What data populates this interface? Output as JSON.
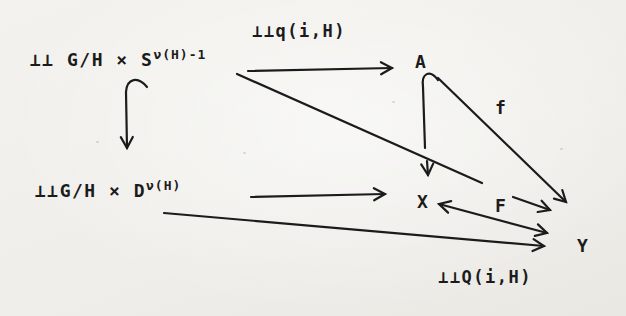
{
  "page": {
    "background": "#f1f0ec",
    "ink": "#1b1b1b",
    "kind": "scanned typewritten commutative diagram"
  },
  "diagram": {
    "nodes": {
      "top_left": {
        "base": "⊥⊥ G/H × S",
        "sup": "ν(H)-1"
      },
      "bottom_left": {
        "base": "⊥⊥G/H × D",
        "sup": "ν(H)"
      },
      "A": "A",
      "X": "X",
      "Y": "Y"
    },
    "labels": {
      "q_arrow": "⊥⊥q(i,H)",
      "f": "f",
      "F": "F",
      "Q_bottom": "⊥⊥Q(i,H)"
    },
    "arrows": [
      {
        "name": "q-arrow",
        "from": "⊥⊥ G/H × S^ν(H)-1",
        "to": "A",
        "label": "⊥⊥q(i,H)",
        "style": "straight"
      },
      {
        "name": "left-inclusion",
        "from": "⊥⊥ G/H × S^ν(H)-1",
        "to": "⊥⊥G/H × D^ν(H)",
        "style": "hooked-tail"
      },
      {
        "name": "a-inclusion",
        "from": "A",
        "to": "X",
        "style": "hooked-tail"
      },
      {
        "name": "d-to-x",
        "from": "⊥⊥G/H × D^ν(H)",
        "to": "X",
        "style": "straight"
      },
      {
        "name": "f-arrow",
        "from": "A",
        "to": "Y",
        "label": "f",
        "style": "straight"
      },
      {
        "name": "s-to-y",
        "from": "⊥⊥ G/H × S^ν(H)-1",
        "to": "Y",
        "style": "straight-with-gap"
      },
      {
        "name": "x-y-double",
        "from": "X",
        "to": "Y",
        "label": "F",
        "style": "double-headed"
      },
      {
        "name": "d-to-y",
        "from": "⊥⊥G/H × D^ν(H)",
        "to": "Y",
        "label": "⊥⊥Q(i,H)",
        "style": "straight"
      }
    ]
  }
}
